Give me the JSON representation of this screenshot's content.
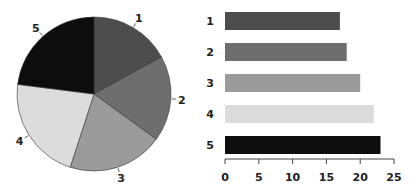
{
  "chart_data": [
    {
      "type": "pie",
      "title": "",
      "labels": [
        "1",
        "2",
        "3",
        "4",
        "5"
      ],
      "values": [
        17,
        18,
        20,
        22,
        23
      ],
      "colors": [
        "#4d4d4d",
        "#6e6e6e",
        "#9a9a9a",
        "#dcdcdc",
        "#0d0d0d"
      ],
      "start_angle": "12 o'clock",
      "direction": "clockwise",
      "legend": "none"
    },
    {
      "type": "bar",
      "orientation": "horizontal",
      "title": "",
      "categories": [
        "1",
        "2",
        "3",
        "4",
        "5"
      ],
      "values": [
        17,
        18,
        20,
        22,
        23
      ],
      "colors": [
        "#4d4d4d",
        "#6e6e6e",
        "#9a9a9a",
        "#dcdcdc",
        "#0d0d0d"
      ],
      "xlabel": "",
      "ylabel": "",
      "xlim": [
        0,
        25
      ],
      "xticks": [
        "0",
        "5",
        "10",
        "15",
        "20",
        "25"
      ],
      "grid": false,
      "legend": "none"
    }
  ]
}
